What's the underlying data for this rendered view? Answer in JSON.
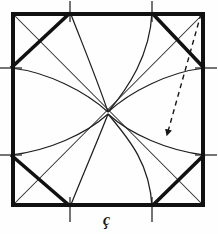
{
  "figure": {
    "annotation_label": "ç",
    "colors": {
      "ink": "#151515",
      "thin_ink": "#2b2b2b",
      "background": "#fefefe"
    },
    "square": {
      "left": 11,
      "top": 12,
      "right": 205,
      "bottom": 207,
      "stroke_width": 4
    },
    "tick_positions": {
      "top_x": [
        70,
        152
      ],
      "bottom_x": [
        70,
        152
      ],
      "left_y": [
        68,
        155
      ],
      "right_y": [
        68,
        155
      ],
      "overhang": 11
    },
    "center_point": {
      "x": 108,
      "y": 113
    },
    "thick_chords": [
      {
        "name": "top-left-chord",
        "x1": 11,
        "y1": 68,
        "x2": 70,
        "y2": 12
      },
      {
        "name": "top-right-chord",
        "x1": 152,
        "y1": 12,
        "x2": 205,
        "y2": 68
      },
      {
        "name": "bottom-left-chord",
        "x1": 11,
        "y1": 155,
        "x2": 70,
        "y2": 207
      },
      {
        "name": "bottom-right-chord",
        "x1": 152,
        "y1": 207,
        "x2": 205,
        "y2": 155
      }
    ],
    "thin_diagonals": [
      {
        "name": "diagonal-tl-br",
        "x1": 11,
        "y1": 12,
        "x2": 205,
        "y2": 207
      },
      {
        "name": "diagonal-tr-bl",
        "x1": 205,
        "y1": 12,
        "x2": 11,
        "y2": 207
      }
    ],
    "thin_chords": [
      {
        "name": "thin-chord-top-left",
        "x1": 11,
        "y1": 68,
        "x2": 70,
        "y2": 12
      },
      {
        "name": "thin-chord-bottom-right",
        "x1": 152,
        "y1": 207,
        "x2": 205,
        "y2": 155
      }
    ],
    "arcs": [
      {
        "name": "arc-top-left",
        "from_x": 70,
        "from_y": 12,
        "to_x": 108,
        "to_y": 113,
        "bow": "right"
      },
      {
        "name": "arc-top-right",
        "from_x": 152,
        "from_y": 12,
        "to_x": 108,
        "to_y": 113,
        "bow": "left"
      },
      {
        "name": "arc-bottom-left",
        "from_x": 70,
        "from_y": 207,
        "to_x": 108,
        "to_y": 113,
        "bow": "right"
      },
      {
        "name": "arc-bottom-right",
        "from_x": 152,
        "from_y": 207,
        "to_x": 108,
        "to_y": 113,
        "bow": "left"
      },
      {
        "name": "arc-left-upper",
        "from_x": 11,
        "from_y": 68,
        "to_x": 108,
        "to_y": 113,
        "bow": "up"
      },
      {
        "name": "arc-right-upper",
        "from_x": 205,
        "from_y": 68,
        "to_x": 108,
        "to_y": 113,
        "bow": "up"
      },
      {
        "name": "arc-left-lower",
        "from_x": 11,
        "from_y": 155,
        "to_x": 108,
        "to_y": 113,
        "bow": "down"
      },
      {
        "name": "arc-right-lower",
        "from_x": 205,
        "from_y": 155,
        "to_x": 108,
        "to_y": 113,
        "bow": "down"
      }
    ],
    "dashed_arrow": {
      "name": "radius-arrow",
      "from_x": 201,
      "from_y": 14,
      "to_x": 166,
      "to_y": 137,
      "dash_pattern": "5 4",
      "stroke_width": 1.4,
      "has_arrowhead": true
    }
  }
}
